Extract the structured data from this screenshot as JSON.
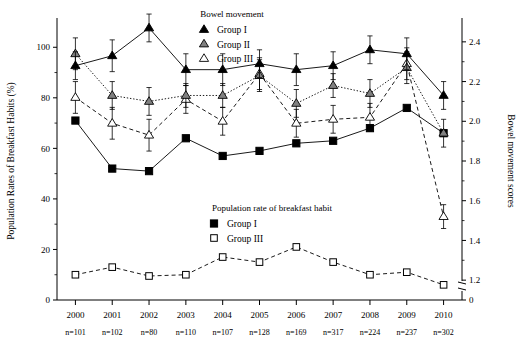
{
  "chart_data": {
    "type": "line",
    "title": "",
    "xlabel": "",
    "ylabel": "Population Rates of Breakfast Habits (%)",
    "y2label": "Bowel movement scores",
    "categories": [
      "2000",
      "2001",
      "2002",
      "2003",
      "2004",
      "2005",
      "2006",
      "2007",
      "2008",
      "2009",
      "2010"
    ],
    "sample_sizes": [
      "n=101",
      "n=102",
      "n=80",
      "n=110",
      "n=107",
      "n=128",
      "n=169",
      "n=317",
      "n=224",
      "n=237",
      "n=302"
    ],
    "ylim": [
      0,
      110
    ],
    "yticks": [
      0,
      20,
      40,
      60,
      80,
      100
    ],
    "ytick_labels": [
      "0",
      "20",
      "40",
      "60",
      "80",
      "100"
    ],
    "y2lim": [
      1.1,
      2.5
    ],
    "y2ticks": [
      1.2,
      1.4,
      1.6,
      1.8,
      2.0,
      2.2,
      2.4
    ],
    "y2tick_labels": [
      "1.2",
      "1.4",
      "1.6",
      "1.8",
      "2.0",
      "2.2",
      "2.4"
    ],
    "y2_zero_label": "0",
    "y2_axis_break": true,
    "grid": false,
    "legend_position": "inside-top-center / inside-bottom-center",
    "series": [
      {
        "name": "Group I",
        "panel": "Bowel movement",
        "axis": "right",
        "marker": "filled-triangle",
        "line_style": "solid",
        "values": [
          2.28,
          2.33,
          2.47,
          2.26,
          2.26,
          2.29,
          2.26,
          2.28,
          2.36,
          2.34,
          2.13
        ],
        "errors": [
          0.07,
          0.08,
          0.07,
          0.08,
          0.08,
          0.07,
          0.08,
          0.07,
          0.07,
          0.08,
          0.07
        ]
      },
      {
        "name": "Group II",
        "panel": "Bowel movement",
        "axis": "right",
        "marker": "gray-triangle",
        "line_style": "dotted",
        "values": [
          2.34,
          2.13,
          2.1,
          2.13,
          2.13,
          2.23,
          2.09,
          2.18,
          2.14,
          2.27,
          1.94
        ],
        "errors": [
          0.08,
          0.07,
          0.07,
          0.06,
          0.06,
          0.08,
          0.07,
          0.06,
          0.07,
          0.08,
          0.07
        ]
      },
      {
        "name": "Group III",
        "panel": "Bowel movement",
        "axis": "right",
        "marker": "open-triangle",
        "line_style": "dashed",
        "values": [
          2.12,
          1.99,
          1.93,
          2.11,
          2.0,
          2.24,
          1.99,
          2.01,
          2.02,
          2.29,
          1.52
        ],
        "errors": [
          0.08,
          0.08,
          0.08,
          0.07,
          0.07,
          0.08,
          0.07,
          0.07,
          0.07,
          0.08,
          0.06
        ]
      },
      {
        "name": "Group I",
        "panel": "Population rate of breakfast habit",
        "axis": "left",
        "marker": "filled-square",
        "line_style": "solid",
        "values": [
          71,
          52,
          51,
          64,
          57,
          59,
          62,
          63,
          68,
          76,
          66
        ]
      },
      {
        "name": "Group III",
        "panel": "Population rate of breakfast habit",
        "axis": "left",
        "marker": "open-square",
        "line_style": "dashed",
        "values": [
          10,
          13,
          9.5,
          10,
          17,
          15,
          21,
          15,
          10,
          11,
          6
        ]
      }
    ],
    "legends": [
      {
        "title": "Bowel movement",
        "items": [
          {
            "label": "Group I",
            "marker": "filled-triangle"
          },
          {
            "label": "Group II",
            "marker": "gray-triangle"
          },
          {
            "label": "Group III",
            "marker": "open-triangle"
          }
        ]
      },
      {
        "title": "Population rate of breakfast habit",
        "items": [
          {
            "label": "Group I",
            "marker": "filled-square"
          },
          {
            "label": "Group III",
            "marker": "open-square"
          }
        ]
      }
    ],
    "colors": {
      "line": "#000000",
      "fill_dark": "#000000",
      "fill_gray": "#808080",
      "fill_open": "#ffffff",
      "axis": "#000000",
      "background": "#ffffff"
    }
  }
}
